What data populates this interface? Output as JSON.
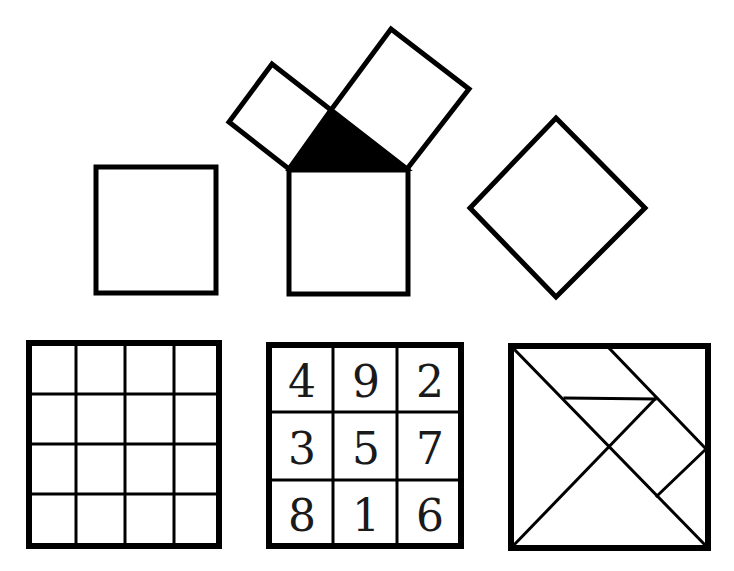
{
  "figure": {
    "colors": {
      "stroke": "#000000",
      "fill": "#ffffff",
      "triangle": "#000000"
    }
  },
  "magic_square": {
    "rows": [
      [
        "4",
        "9",
        "2"
      ],
      [
        "3",
        "5",
        "7"
      ],
      [
        "8",
        "1",
        "6"
      ]
    ]
  },
  "grid": {
    "rows": 4,
    "cols": 4
  },
  "shapes": [
    {
      "name": "plain-square"
    },
    {
      "name": "pythagoras-diagram"
    },
    {
      "name": "diamond-square"
    },
    {
      "name": "grid-4x4"
    },
    {
      "name": "magic-square-3x3"
    },
    {
      "name": "tangram-square"
    }
  ]
}
